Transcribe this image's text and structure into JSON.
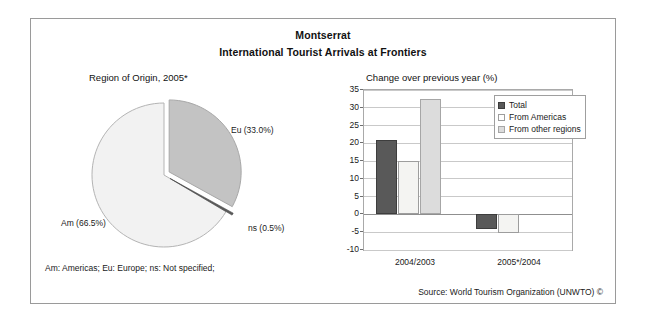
{
  "figure": {
    "title": "Montserrat",
    "subtitle": "International Tourist Arrivals at Frontiers",
    "footnote": "Am: Americas; Eu: Europe; ns: Not specified;",
    "source": "Source: World Tourism Organization (UNWTO) ©"
  },
  "pie_caption": "Region of Origin, 2005*",
  "bar_caption": "Change over previous year (%)",
  "labels": {
    "eu": "Eu (33.0%)",
    "am": "Am (66.5%)",
    "ns": "ns (0.5%)"
  },
  "colors": {
    "eu_slice": "#c3c3c3",
    "am_slice": "#f2f2f2",
    "ns_slice": "#5a5a5a",
    "total_bar": "#595959",
    "americas_bar": "#f4f4f2",
    "other_bar": "#dcdcdc",
    "frame": "#9a9a9a",
    "grid": "#c9c9c9"
  },
  "chart_data": [
    {
      "type": "pie",
      "title": "Region of Origin, 2005*",
      "categories": [
        "Eu",
        "Am",
        "ns"
      ],
      "labels": [
        "Eu (33.0%)",
        "Am (66.5%)",
        "ns (0.5%)"
      ],
      "values": [
        33.0,
        66.5,
        0.5
      ],
      "units": "percent",
      "exploded_slices": [
        "Eu",
        "ns"
      ],
      "legend": "none",
      "colors": [
        "#c3c3c3",
        "#f2f2f2",
        "#5a5a5a"
      ]
    },
    {
      "type": "bar",
      "title": "Change over previous year (%)",
      "xlabel": "",
      "ylabel": "",
      "categories": [
        "2004/2003",
        "2005*/2004"
      ],
      "series": [
        {
          "name": "Total",
          "values": [
            20.8,
            -4.0
          ],
          "color": "#595959"
        },
        {
          "name": "From Americas",
          "values": [
            15.0,
            -5.3
          ],
          "color": "#f4f4f2"
        },
        {
          "name": "From other regions",
          "values": [
            32.5,
            0.0
          ],
          "color": "#dcdcdc"
        }
      ],
      "ylim": [
        -10,
        35
      ],
      "ytick_labels": [
        "35",
        "30",
        "25",
        "20",
        "15",
        "10",
        "5",
        "0",
        "-5",
        "-10"
      ],
      "ytick_values": [
        35,
        30,
        25,
        20,
        15,
        10,
        5,
        0,
        -5,
        -10
      ],
      "grid": true,
      "legend_position": "top-right",
      "legend_entries": [
        "Total",
        "From Americas",
        "From other regions"
      ]
    }
  ]
}
